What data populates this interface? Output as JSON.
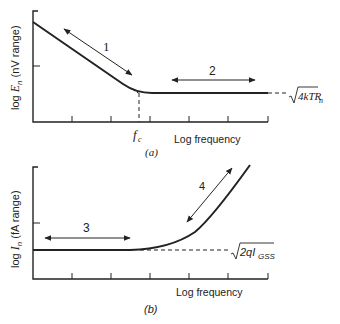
{
  "panel_a": {
    "y_axis_label_prefix": "log ",
    "y_axis_symbol": "E",
    "y_axis_subscript": "n",
    "y_axis_unit": " (nV range)",
    "x_axis_label": "Log frequency",
    "corner_label_italic": "f",
    "corner_label_subscript": "c",
    "caption": "(a)",
    "region1_label": "1",
    "region2_label": "2",
    "asymptote_label_main": "4kTR",
    "asymptote_label_subscript": "n"
  },
  "panel_b": {
    "y_axis_label_prefix": "log ",
    "y_axis_symbol": "I",
    "y_axis_subscript": "n",
    "y_axis_unit": " (fA range)",
    "x_axis_label": "Log frequency",
    "caption": "(b)",
    "region3_label": "3",
    "region4_label": "4",
    "asymptote_label_main": "2qI",
    "asymptote_label_subscript": "GSS"
  },
  "colors": {
    "ink": "#222222",
    "background": "#ffffff"
  }
}
